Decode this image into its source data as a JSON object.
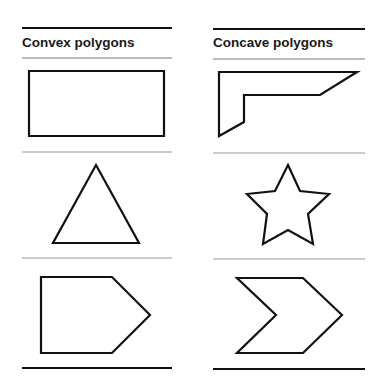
{
  "columns": [
    {
      "title": "Convex polygons",
      "shapes": [
        {
          "name": "rectangle",
          "points": "29,71 164,71 164,136 29,136"
        },
        {
          "name": "triangle",
          "points": "96,165 139,243 53,243"
        },
        {
          "name": "pentagon",
          "points": "41,277 112,277 150,315 112,353 41,353"
        }
      ]
    },
    {
      "title": "Concave polygons",
      "shapes": [
        {
          "name": "l-shape",
          "points": "219,72 357,72 320,95 244,95 244,122 219,136"
        },
        {
          "name": "star",
          "points": "288,165 300,191 329,194 308,214 313,244 288,230 263,244 267,214 247,194 275,191"
        },
        {
          "name": "chevron",
          "points": "237,278 303,278 342,315 303,353 237,353 276,315"
        }
      ]
    }
  ],
  "colors": {
    "stroke": "#111111",
    "rule_thin": "#888888",
    "rule_thick": "#111111"
  }
}
